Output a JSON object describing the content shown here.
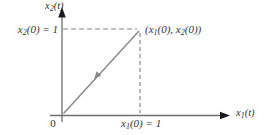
{
  "diagram": {
    "kind": "phase-plane initial-condition trajectory",
    "colors": {
      "background": "#ffffff",
      "axis": "#6f6f6f",
      "arrowhead": "#1c1c1c",
      "trajectory": "#8a8a8a",
      "dashed_guide": "#8a8a8a",
      "text": "#333333"
    },
    "labels": {
      "y_axis": {
        "base": "x",
        "sub": "2",
        "rest": "(t)"
      },
      "x_axis": {
        "base": "x",
        "sub": "1",
        "rest": "(t)"
      },
      "y_value": {
        "base": "x",
        "sub": "2",
        "rest": "(0) = 1"
      },
      "x_value": {
        "base": "x",
        "sub": "1",
        "rest": "(0) = 1"
      },
      "point": {
        "p1": "(x",
        "s1": "1",
        "p2": "(0), x",
        "s2": "2",
        "p3": "(0))"
      },
      "origin": "0"
    },
    "values": {
      "x1_0": 1,
      "x2_0": 1
    }
  }
}
